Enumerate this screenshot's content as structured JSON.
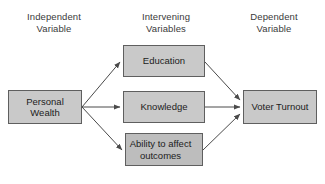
{
  "diagram": {
    "background_color": "#ffffff",
    "headers": [
      {
        "id": "independent",
        "label": "Independent\nVariable"
      },
      {
        "id": "intervening",
        "label": "Intervening\nVariables"
      },
      {
        "id": "dependent",
        "label": "Dependent\nVariable"
      }
    ],
    "nodes": [
      {
        "id": "personal-wealth",
        "label": "Personal\nWealth",
        "column": "independent",
        "fill": "#c9c9c9",
        "stroke": "#5f5f5f"
      },
      {
        "id": "education",
        "label": "Education",
        "column": "intervening",
        "fill": "#c9c9c9",
        "stroke": "#5f5f5f"
      },
      {
        "id": "knowledge",
        "label": "Knowledge",
        "column": "intervening",
        "fill": "#c9c9c9",
        "stroke": "#5f5f5f"
      },
      {
        "id": "ability",
        "label": "Ability to affect\noutcomes",
        "column": "intervening",
        "fill": "#bdbdbd",
        "stroke": "#5f5f5f"
      },
      {
        "id": "voter-turnout",
        "label": "Voter Turnout",
        "column": "dependent",
        "fill": "#c9c9c9",
        "stroke": "#5f5f5f"
      }
    ],
    "edges": [
      {
        "id": "wealth-to-education",
        "from": "personal-wealth",
        "to": "education",
        "arrow": "end"
      },
      {
        "id": "wealth-to-knowledge",
        "from": "personal-wealth",
        "to": "knowledge",
        "arrow": "end"
      },
      {
        "id": "wealth-to-ability",
        "from": "personal-wealth",
        "to": "ability",
        "arrow": "end"
      },
      {
        "id": "education-to-voter-turnout",
        "from": "education",
        "to": "voter-turnout",
        "arrow": "end"
      },
      {
        "id": "knowledge-to-voter-turnout",
        "from": "knowledge",
        "to": "voter-turnout",
        "arrow": "end"
      },
      {
        "id": "ability-to-voter-turnout",
        "from": "ability",
        "to": "voter-turnout",
        "arrow": "end"
      }
    ],
    "edge_color": "#4a4a4a"
  }
}
